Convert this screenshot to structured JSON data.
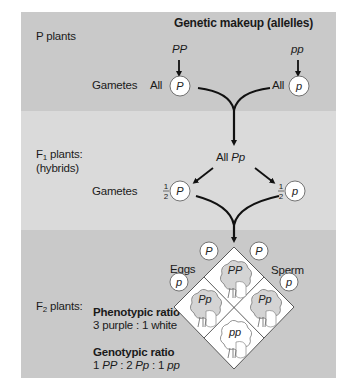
{
  "header": {
    "title": "Genetic makeup (allelles)"
  },
  "p_generation": {
    "label": "P plants",
    "gametes_label": "Gametes",
    "left_parent": {
      "genotype": "PP",
      "gamete_prefix": "All",
      "gamete_allele": "P"
    },
    "right_parent": {
      "genotype": "pp",
      "gamete_prefix": "All",
      "gamete_allele": "p"
    }
  },
  "f1_generation": {
    "label_main": "F",
    "label_sub": "1",
    "label_suffix": " plants:",
    "label_line2": "(hybrids)",
    "offspring_prefix": "All ",
    "offspring_genotype": "Pp",
    "gametes_label": "Gametes",
    "left_gamete": {
      "fraction_num": "1",
      "fraction_den": "2",
      "allele": "P"
    },
    "right_gamete": {
      "fraction_num": "1",
      "fraction_den": "2",
      "allele": "p"
    }
  },
  "f2_generation": {
    "label_main": "F",
    "label_sub": "2",
    "label_suffix": " plants:",
    "eggs_label": "Eggs",
    "sperm_label": "Sperm",
    "eggs_alleles": [
      "P",
      "p"
    ],
    "sperm_alleles": [
      "P",
      "p"
    ],
    "punnett_cells": [
      {
        "position": "top",
        "genotype": "PP",
        "phenotype": "purple"
      },
      {
        "position": "left",
        "genotype": "Pp",
        "phenotype": "purple"
      },
      {
        "position": "right",
        "genotype": "Pp",
        "phenotype": "purple"
      },
      {
        "position": "bottom",
        "genotype": "pp",
        "phenotype": "white"
      }
    ],
    "phenotypic_ratio": {
      "title": "Phenotypic ratio",
      "value": "3 purple : 1 white"
    },
    "genotypic_ratio": {
      "title": "Genotypic ratio",
      "parts": [
        {
          "count": "1 ",
          "genotype": "PP",
          "sep": " : "
        },
        {
          "count": "2 ",
          "genotype": "Pp",
          "sep": " : "
        },
        {
          "count": "1 ",
          "genotype": "pp",
          "sep": ""
        }
      ]
    }
  },
  "colors": {
    "band_dark": "#c9c9c9",
    "band_light": "#dadada",
    "flower_purple_fill": "#d4d4d4",
    "flower_white_fill": "#ffffff",
    "stroke": "#111111"
  }
}
